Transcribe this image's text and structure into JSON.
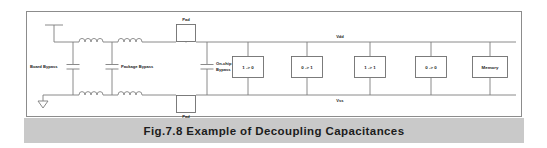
{
  "figure": {
    "caption": "Fig.7.8 Example of Decoupling Capacitances",
    "frame": {
      "border_color": "#8c8c8c",
      "background": "#ffffff"
    },
    "caption_bar": {
      "background": "#c9c9c9",
      "text_color": "#1c1c1c"
    }
  },
  "rails": {
    "top_label": "Vdd",
    "bottom_label": "Vss",
    "wire_color": "#7d7d7d"
  },
  "capacitors": [
    {
      "id": "board-bypass",
      "label": "Board Bypass"
    },
    {
      "id": "package-bypass",
      "label": "Package Bypass"
    },
    {
      "id": "on-chip-bypass",
      "label_line1": "On-chip",
      "label_line2": "Bypass"
    }
  ],
  "pads": [
    {
      "id": "pad-top",
      "label": "Pad"
    },
    {
      "id": "pad-bottom",
      "label": "Pad"
    }
  ],
  "inductors": [
    {
      "id": "inductor-top-board",
      "turns": 4
    },
    {
      "id": "inductor-top-package",
      "turns": 4
    },
    {
      "id": "inductor-bottom-board",
      "turns": 4
    },
    {
      "id": "inductor-bottom-package",
      "turns": 4
    }
  ],
  "ground": {
    "id": "ground-symbol",
    "shape": "triangle"
  },
  "supply_terminal": {
    "id": "supply-terminal",
    "shape": "tee"
  },
  "blocks": [
    {
      "id": "gate-1-to-0",
      "label": "1 -> 0"
    },
    {
      "id": "gate-0-to-1",
      "label": "0 -> 1"
    },
    {
      "id": "gate-1-to-1",
      "label": "1 -> 1"
    },
    {
      "id": "gate-0-to-0",
      "label": "0 -> 0"
    },
    {
      "id": "memory",
      "label": "Memory"
    }
  ]
}
